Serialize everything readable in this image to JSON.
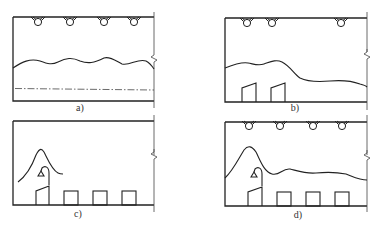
{
  "figure": {
    "panels": [
      {
        "id": "a",
        "label": "a)",
        "description": "Uniform ceiling lighting, four lamps, uniform wavy illuminance curve, dash-dot reference line"
      },
      {
        "id": "b",
        "label": "b)",
        "description": "Three lamps (two left, one right), illuminance higher over two work stations on the left"
      },
      {
        "id": "c",
        "label": "c)",
        "description": "No ceiling lamps, local task lamp at first station, peaked illuminance curve over it, four work stations"
      },
      {
        "id": "d",
        "label": "d)",
        "description": "Four ceiling lamps plus local task lamp, peak over first station and uniform level elsewhere, four work stations"
      }
    ],
    "symbols": {
      "ceiling_lamp": "lamp-icon",
      "task_lamp": "desk-lamp-icon",
      "work_station": "workbench-icon",
      "break_mark": "break-line-icon"
    },
    "colors": {
      "line": "#222222",
      "background": "#ffffff"
    }
  }
}
